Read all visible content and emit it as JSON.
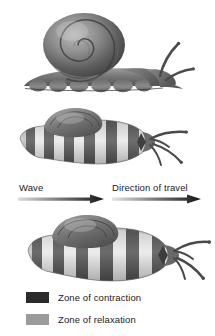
{
  "figure": {
    "background": "#ffffff"
  },
  "panels": {
    "side_view": {
      "name": "snail-side-view",
      "description": "Side view of snail with coiled shell, extended head with two tentacles, and scalloped pedal waves along the underside of the foot"
    },
    "top_view_small": {
      "name": "snail-top-view-small",
      "description": "Dorsal view of snail foot showing alternating dark contraction bands and light relaxation bands with shell at upper left and four tentacles at right"
    },
    "top_view_large": {
      "name": "snail-top-view-large",
      "description": "Larger dorsal view of snail foot with alternating contraction and relaxation bands"
    }
  },
  "arrows": {
    "wave": {
      "label": "Wave",
      "direction": "right",
      "gradient_from": "#d8d8d8",
      "gradient_to": "#1a1a1a"
    },
    "travel": {
      "label": "Direction of travel",
      "direction": "right",
      "gradient_from": "#e2e2e2",
      "gradient_to": "#1a1a1a"
    }
  },
  "legend": {
    "items": [
      {
        "label": "Zone of contraction",
        "color": "#2b2b2b"
      },
      {
        "label": "Zone of relaxation",
        "color": "#9b9b9b"
      }
    ]
  },
  "colors": {
    "contraction": "#2b2b2b",
    "relaxation": "#9b9b9b",
    "text": "#1b1b1b",
    "shell_dark": "#4a4a4a",
    "shell_light": "#b9b9b9",
    "body_mid": "#8e8e8e"
  }
}
